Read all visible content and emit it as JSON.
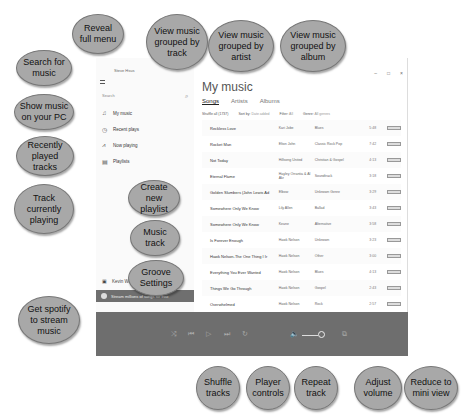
{
  "page_heading_fragment": "...on the music screen.",
  "app": {
    "user_name_top": "Steve Hsus",
    "search_placeholder": "Search",
    "nav": [
      {
        "icon": "music-note-icon",
        "label": "My music"
      },
      {
        "icon": "clock-icon",
        "label": "Recent plays"
      },
      {
        "icon": "now-playing-icon",
        "label": "Now playing"
      },
      {
        "icon": "playlist-icon",
        "label": "Playlists"
      }
    ],
    "user_name_bottom": "Kevin Wilson",
    "spotify_banner": "Stream millions of songs for free",
    "title": "My music",
    "tabs": [
      "Songs",
      "Artists",
      "Albums"
    ],
    "active_tab": "Songs",
    "filters": {
      "shuffle": "Shuffle all (1737)",
      "sort_label": "Sort by:",
      "sort_value": "Date added",
      "filter_label": "Filter:",
      "filter_value": "All",
      "genre_label": "Genre:",
      "genre_value": "All genres"
    },
    "window_controls": [
      "–",
      "□",
      "×"
    ],
    "tracks": [
      {
        "title": "Reckless Love",
        "artist": "Kari Jobe",
        "genre": "Blues",
        "duration": "5:48"
      },
      {
        "title": "Rocket Man",
        "artist": "Elton John",
        "genre": "Classic Rock Pop",
        "duration": "7:42"
      },
      {
        "title": "Not Today",
        "artist": "Hillsong United",
        "genre": "Christian & Gospel",
        "duration": "4:13"
      },
      {
        "title": "Eternal Flame",
        "artist": "Hayley Orrantia & Al Akr",
        "genre": "Soundtrack",
        "duration": "3:18"
      },
      {
        "title": "Golden Slumbers (John Lewis Ad",
        "artist": "Elbow",
        "genre": "Unknown Genre",
        "duration": "3:29"
      },
      {
        "title": "Somewhere Only We Know",
        "artist": "Lily Allen",
        "genre": "Ballad",
        "duration": "3:43"
      },
      {
        "title": "Somewhere Only We Know",
        "artist": "Keane",
        "genre": "Alternative",
        "duration": "3:58"
      },
      {
        "title": "Is Forever Enough",
        "artist": "Hawk Nelson",
        "genre": "Unknown",
        "duration": "3:23"
      },
      {
        "title": "Hawk Nelson-The One Thing I Ir",
        "artist": "Hawk Nelson",
        "genre": "Other",
        "duration": "3:00"
      },
      {
        "title": "Everything You Ever Wanted",
        "artist": "Hawk Nelson",
        "genre": "Blues",
        "duration": "4:13"
      },
      {
        "title": "Things We Go Through",
        "artist": "Hawk Nelson",
        "genre": "Gospel",
        "duration": "2:43"
      },
      {
        "title": "Overwhelmed",
        "artist": "Hawk Nelson",
        "genre": "Rock",
        "duration": "2:57"
      },
      {
        "title": "Bring 'Em Out",
        "artist": "Hawk Nelson",
        "genre": "Soundtrack",
        "duration": "3:23"
      }
    ]
  },
  "callouts": {
    "reveal_menu": "Reveal full menu",
    "search": "Search for music",
    "show_music": "Show music on your PC",
    "recent": "Recently played tracks",
    "playing": "Track currently playing",
    "by_track": "View music grouped by track",
    "by_artist": "View music grouped by artist",
    "by_album": "View music grouped by album",
    "new_playlist": "Create new playlist",
    "music_track": "Music track",
    "groove_settings": "Groove Settings",
    "spotify": "Get spotify to stream music",
    "shuffle": "Shuffle tracks",
    "player": "Player controls",
    "repeat": "Repeat track",
    "volume": "Adjust volume",
    "mini": "Reduce to mini view"
  }
}
